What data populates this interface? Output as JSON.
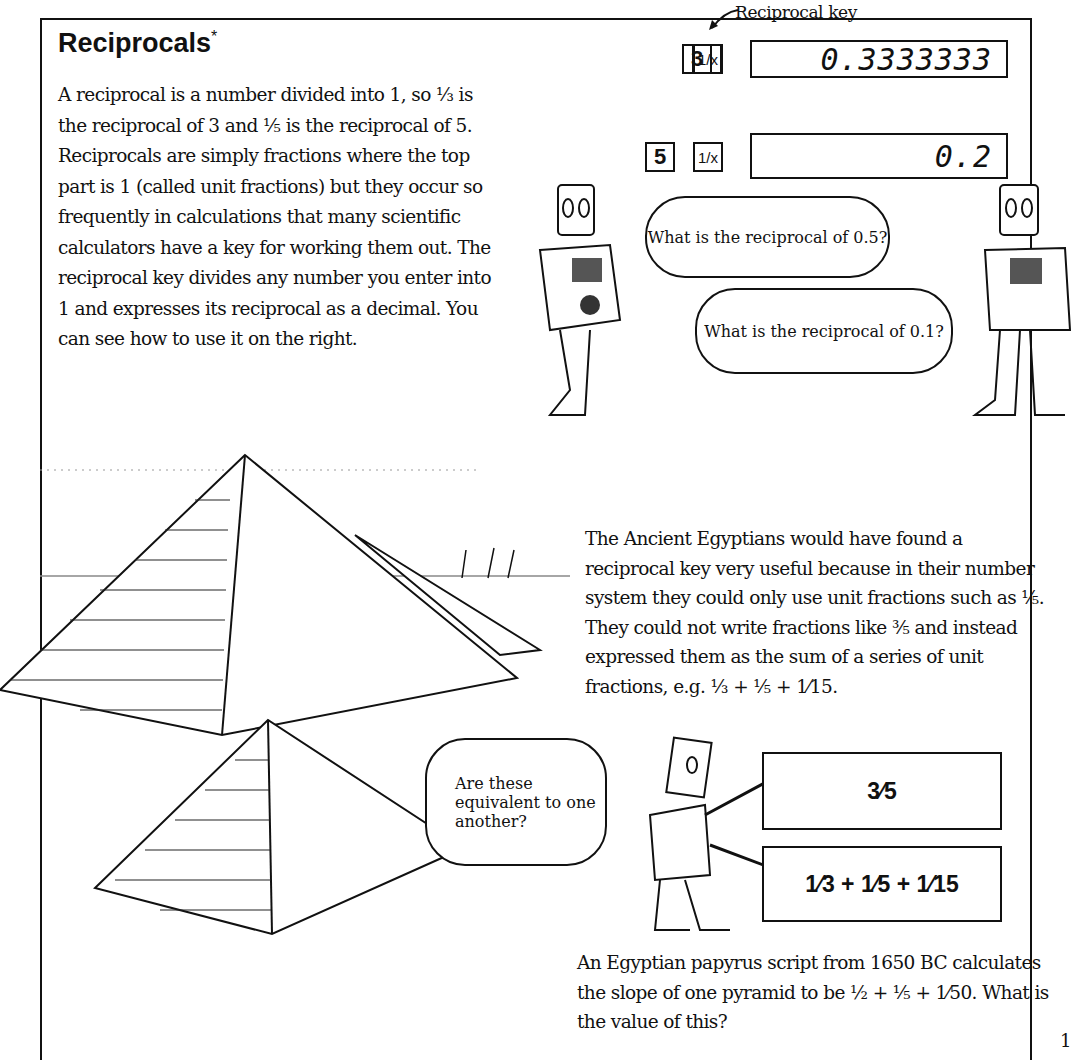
{
  "heading": {
    "title": "Reciprocals",
    "marker": "*"
  },
  "intro": {
    "text": "A reciprocal is a number divided into 1, so ⅓ is the reciprocal of 3 and ⅕ is the reciprocal of 5. Reciprocals are simply fractions where the top part is 1 (called unit fractions) but they occur so frequently in calculations that many scientific calculators have a key for working them out. The reciprocal key divides any number you enter into 1 and expresses its reciprocal as a decimal. You can see how to use it on the right."
  },
  "calculator": {
    "callout_label": "Reciprocal key",
    "rows": [
      {
        "number_key": "3",
        "recip_key": "1/x",
        "display": "0.3333333"
      },
      {
        "number_key": "5",
        "recip_key": "1/x",
        "display": "0.2"
      }
    ]
  },
  "robots": {
    "bubble_1": "What is the reciprocal of 0.5?",
    "bubble_2": "What is the reciprocal of 0.1?",
    "bubble_3": "Are these equivalent to one another?"
  },
  "egypt": {
    "text": "The Ancient Egyptians would have found a reciprocal key very useful because in their number system they could only use unit fractions such as ⅕. They could not write fractions like ⅗ and instead expressed them as the sum of a series of unit fractions, e.g. ⅓ + ⅕ + 1⁄15."
  },
  "fraction_boxes": {
    "top": "3⁄5",
    "bottom": "1⁄3 + 1⁄5 + 1⁄15"
  },
  "papyrus": {
    "text": "An Egyptian papyrus script from 1650 BC calculates the slope of one pyramid to be ½ + ⅕ + 1⁄50. What is the value of this?"
  },
  "page_number": "1"
}
